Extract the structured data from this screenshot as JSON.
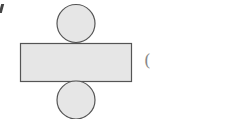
{
  "diagram": {
    "shapes": [
      {
        "type": "circle",
        "role": "top-base",
        "cx": 76,
        "cy": 23.5,
        "r": 19
      },
      {
        "type": "rect",
        "role": "lateral-surface",
        "x": 20,
        "y": 43,
        "width": 111,
        "height": 38
      },
      {
        "type": "circle",
        "role": "bottom-base",
        "cx": 76,
        "cy": 100,
        "r": 19
      }
    ],
    "fill_color": "#e6e6e6",
    "stroke_color": "#555555",
    "answer_blank": "("
  }
}
